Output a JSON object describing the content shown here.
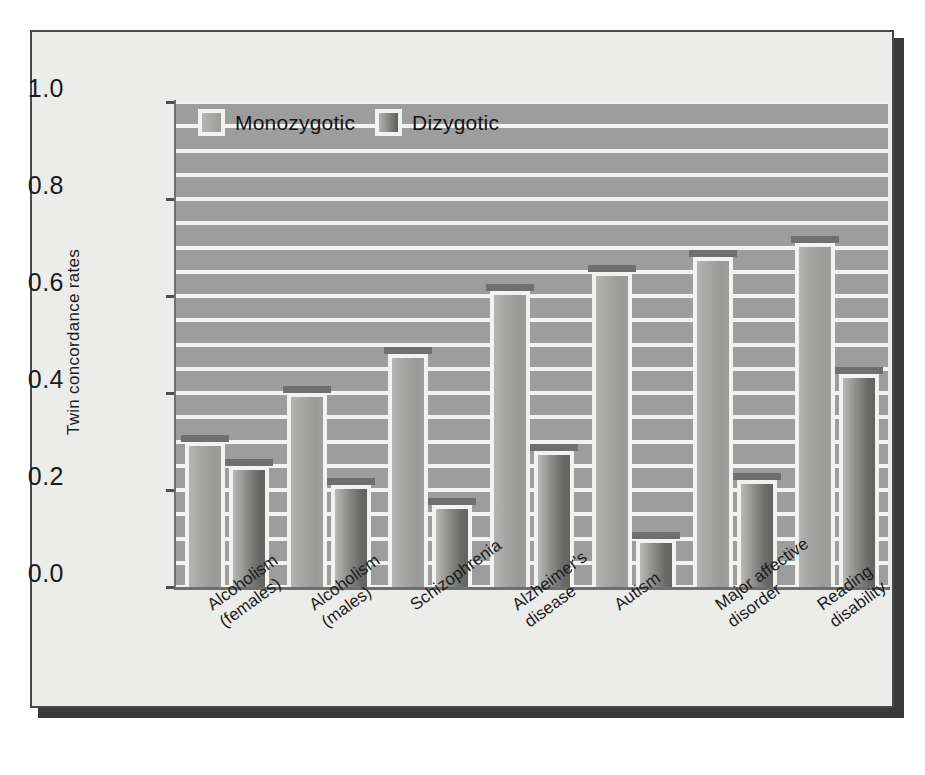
{
  "chart_data": {
    "type": "bar",
    "title": "",
    "xlabel": "",
    "ylabel": "Twin concordance rates",
    "ylim": [
      0.0,
      1.0
    ],
    "ytick_labels": [
      "0.0",
      "0.2",
      "0.4",
      "0.6",
      "0.8",
      "1.0"
    ],
    "ytick_values": [
      0.0,
      0.2,
      0.4,
      0.6,
      0.8,
      1.0
    ],
    "grid": "horizontal-minor-0.05",
    "legend_position": "top-left-inside",
    "categories": [
      "Alcoholism\n(females)",
      "Alcoholism\n(males)",
      "Schizophrenia",
      "Alzheimer's\ndisease",
      "Autism",
      "Major affective\ndisorder",
      "Reading\ndisability"
    ],
    "series": [
      {
        "name": "Monozygotic",
        "color": "#a6a6a4",
        "values": [
          0.3,
          0.4,
          0.48,
          0.61,
          0.65,
          0.68,
          0.71
        ]
      },
      {
        "name": "Dizygotic",
        "color": "#6a6a68",
        "values": [
          0.25,
          0.21,
          0.17,
          0.28,
          0.1,
          0.22,
          0.44
        ]
      }
    ]
  },
  "legend": {
    "items": [
      {
        "label": "Monozygotic"
      },
      {
        "label": "Dizygotic"
      }
    ]
  },
  "colors": {
    "panel_background": "#ececeb",
    "plot_background": "#9d9d9d",
    "gridline": "#f2f2f0",
    "axis": "#6f6f71",
    "bar_cap": "#6f6f71",
    "text": "#1b1b1b",
    "frame": "#4a4a4c",
    "shadow": "#3a3a3c"
  }
}
